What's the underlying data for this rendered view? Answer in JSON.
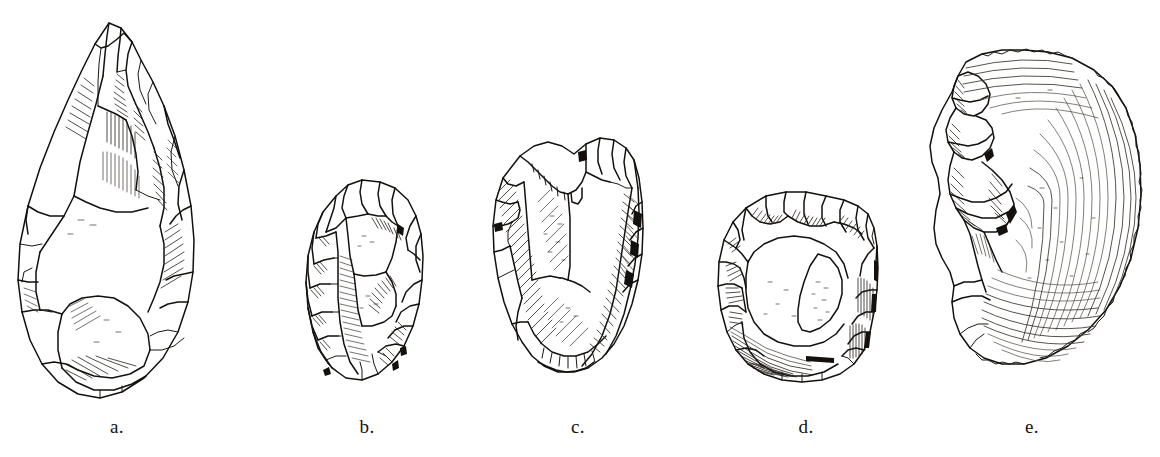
{
  "plate": {
    "kind": "archaeological-illustration-plate",
    "description": "Line-drawing plate of five flaked stone artifacts",
    "background_color": "#ffffff",
    "ink_color": "#13100d",
    "width": 1160,
    "height": 457
  },
  "figures": [
    {
      "key": "a",
      "label": "a.",
      "name": "handaxe",
      "description": "Large teardrop-shaped bifacial handaxe with pointed tip and rounded butt",
      "label_x": 117,
      "bounds": {
        "x": 8,
        "y": 20,
        "w": 196,
        "h": 382
      }
    },
    {
      "key": "b",
      "label": "b.",
      "name": "ovate-biface",
      "description": "Small oval bifacially flaked cobble tool",
      "label_x": 367,
      "bounds": {
        "x": 300,
        "y": 176,
        "w": 130,
        "h": 218
      }
    },
    {
      "key": "c",
      "label": "c.",
      "name": "cleaver",
      "description": "Rectangular flake cleaver with straight transverse bit",
      "label_x": 578,
      "bounds": {
        "x": 478,
        "y": 132,
        "w": 178,
        "h": 266
      }
    },
    {
      "key": "d",
      "label": "d.",
      "name": "discoidal-core",
      "description": "Rounded discoidal chopping core with cortex patch",
      "label_x": 806,
      "bounds": {
        "x": 698,
        "y": 186,
        "w": 194,
        "h": 208
      }
    },
    {
      "key": "e",
      "label": "e.",
      "name": "large-flake",
      "description": "Large crescentic flake with prominent bulb of percussion and concentric ripple marks",
      "label_x": 1032,
      "bounds": {
        "x": 920,
        "y": 28,
        "w": 230,
        "h": 376
      }
    }
  ]
}
